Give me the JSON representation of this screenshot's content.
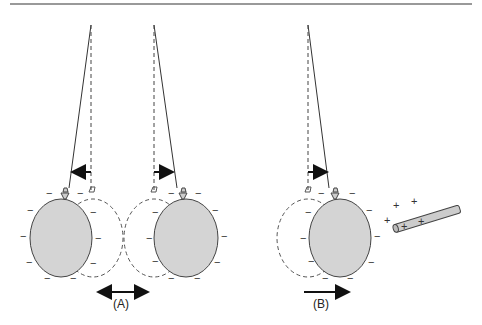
{
  "figure": {
    "panels": [
      {
        "id": "A",
        "label": "(A)",
        "description": "Two negatively charged balloons hanging from strings repel each other",
        "balloon_fill": "#d4d4d4",
        "charge_symbol": "−"
      },
      {
        "id": "B",
        "label": "(B)",
        "description": "Negatively charged balloon attracted toward positively charged rod",
        "balloon_fill": "#d4d4d4",
        "charge_symbol": "−",
        "rod_charge_symbol": "+"
      }
    ],
    "colors": {
      "line": "#333333",
      "balloon_fill": "#d4d4d4",
      "rod_fill": "#cccccc",
      "top_rule": "#777777"
    }
  }
}
